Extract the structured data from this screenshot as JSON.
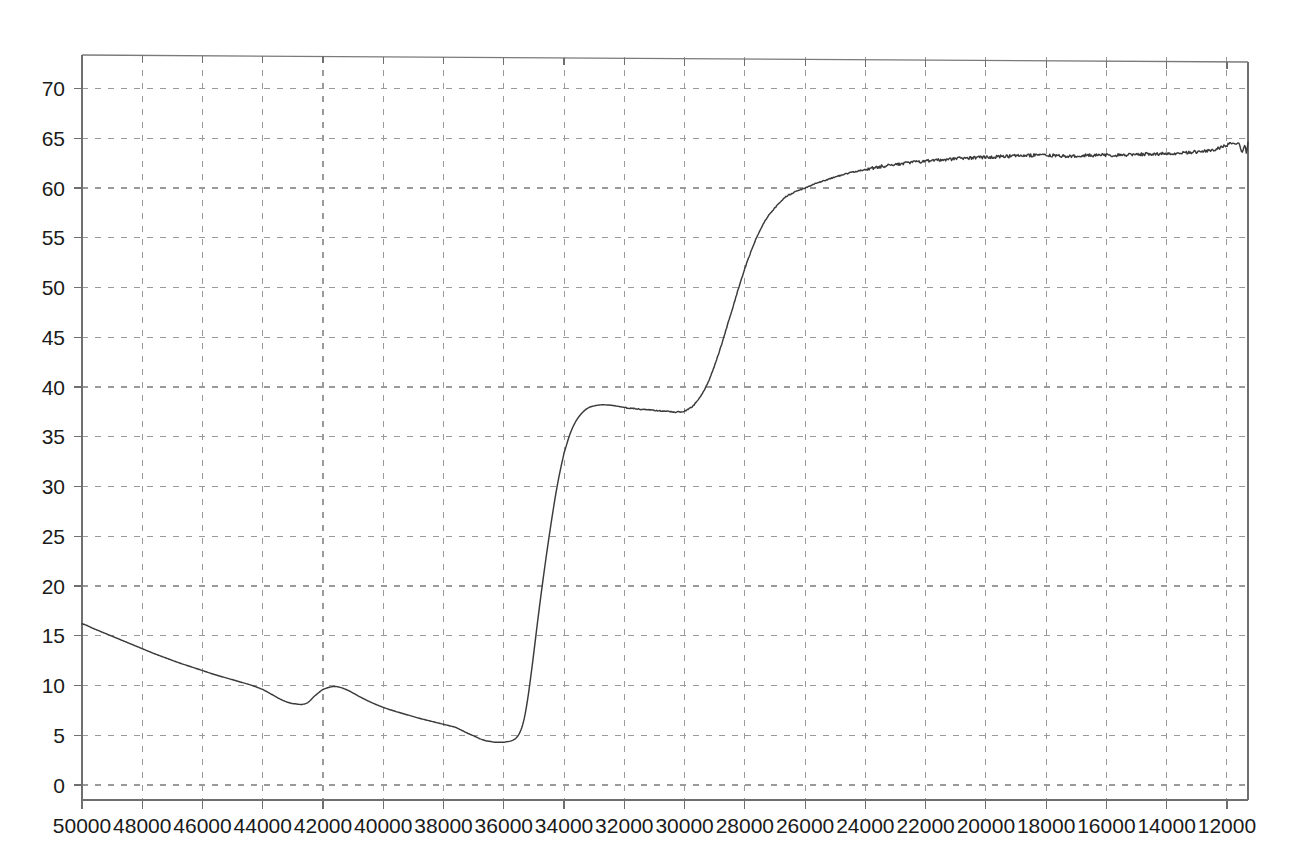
{
  "chart_data": {
    "type": "line",
    "title": "",
    "subtitle": "",
    "xlabel": "",
    "ylabel": "",
    "xlim": [
      50000,
      11300
    ],
    "ylim": [
      0,
      72.5
    ],
    "x_inverted": true,
    "grid": true,
    "legend": null,
    "x_ticks": [
      50000,
      48000,
      46000,
      44000,
      42000,
      40000,
      38000,
      36000,
      34000,
      32000,
      30000,
      28000,
      26000,
      24000,
      22000,
      20000,
      18000,
      16000,
      14000,
      12000
    ],
    "x_tick_labels": [
      "50000",
      "48000",
      "46000",
      "44000",
      "42000",
      "40000",
      "38000",
      "36000",
      "34000",
      "32000",
      "30000",
      "28000",
      "26000",
      "24000",
      "22000",
      "20000",
      "18000",
      "16000",
      "14000",
      "12000"
    ],
    "y_ticks": [
      0,
      5,
      10,
      15,
      20,
      25,
      30,
      35,
      40,
      45,
      50,
      55,
      60,
      65,
      70
    ],
    "y_tick_labels": [
      "0",
      "5",
      "10",
      "15",
      "20",
      "25",
      "30",
      "35",
      "40",
      "45",
      "50",
      "55",
      "60",
      "65",
      "70"
    ],
    "series": [
      {
        "name": "transmittance",
        "color": "#3b3b3b",
        "x": [
          50000,
          49600,
          49200,
          48800,
          48400,
          48000,
          47600,
          47200,
          46800,
          46400,
          46000,
          45600,
          45200,
          44800,
          44400,
          44000,
          43700,
          43400,
          43100,
          42900,
          42700,
          42500,
          42300,
          42000,
          41600,
          41200,
          40800,
          40400,
          40000,
          39600,
          39200,
          38800,
          38400,
          38000,
          37600,
          37400,
          37200,
          37000,
          36900,
          36800,
          36700,
          36600,
          36500,
          36400,
          36300,
          36200,
          36100,
          36000,
          35900,
          35800,
          35700,
          35600,
          35500,
          35400,
          35300,
          35200,
          35100,
          35000,
          34900,
          34800,
          34700,
          34600,
          34500,
          34400,
          34300,
          34200,
          34100,
          34000,
          33800,
          33600,
          33400,
          33200,
          33000,
          32800,
          32600,
          32400,
          32200,
          32000,
          31800,
          31600,
          31400,
          31200,
          31000,
          30800,
          30600,
          30400,
          30200,
          30000,
          29800,
          29600,
          29400,
          29200,
          29000,
          28800,
          28600,
          28400,
          28200,
          28000,
          27800,
          27600,
          27400,
          27200,
          27000,
          26800,
          26600,
          26400,
          26200,
          26000,
          25600,
          25200,
          24800,
          24400,
          24000,
          23600,
          23200,
          22800,
          22400,
          22000,
          21600,
          21200,
          20800,
          20400,
          20000,
          19600,
          19200,
          18800,
          18400,
          18000,
          17600,
          17200,
          16800,
          16400,
          16000,
          15600,
          15200,
          14800,
          14400,
          14000,
          13600,
          13200,
          12800,
          12400,
          12000,
          11800,
          11700,
          11600,
          11500,
          11400,
          11350,
          11300
        ],
        "y": [
          16.2,
          15.7,
          15.2,
          14.7,
          14.2,
          13.7,
          13.2,
          12.75,
          12.3,
          11.9,
          11.5,
          11.1,
          10.75,
          10.4,
          10.05,
          9.6,
          9.1,
          8.6,
          8.25,
          8.15,
          8.1,
          8.3,
          8.9,
          9.6,
          9.9,
          9.55,
          8.9,
          8.3,
          7.8,
          7.4,
          7.05,
          6.7,
          6.4,
          6.1,
          5.8,
          5.5,
          5.2,
          4.95,
          4.8,
          4.65,
          4.55,
          4.45,
          4.4,
          4.35,
          4.3,
          4.3,
          4.3,
          4.3,
          4.35,
          4.4,
          4.5,
          4.7,
          5.1,
          5.8,
          7.0,
          8.8,
          11.0,
          13.4,
          15.9,
          18.3,
          20.6,
          22.8,
          24.9,
          26.9,
          28.8,
          30.5,
          32.0,
          33.4,
          35.3,
          36.6,
          37.4,
          37.9,
          38.1,
          38.2,
          38.2,
          38.15,
          38.05,
          37.95,
          37.85,
          37.8,
          37.75,
          37.7,
          37.65,
          37.6,
          37.55,
          37.5,
          37.5,
          37.6,
          37.9,
          38.5,
          39.4,
          40.6,
          42.2,
          44.0,
          46.0,
          48.0,
          50.0,
          51.9,
          53.6,
          55.1,
          56.3,
          57.3,
          58.0,
          58.7,
          59.2,
          59.5,
          59.8,
          60.0,
          60.5,
          60.9,
          61.3,
          61.6,
          61.85,
          62.1,
          62.3,
          62.45,
          62.6,
          62.7,
          62.8,
          62.9,
          63.0,
          63.05,
          63.1,
          63.15,
          63.2,
          63.25,
          63.3,
          63.3,
          63.25,
          63.2,
          63.25,
          63.3,
          63.3,
          63.3,
          63.35,
          63.4,
          63.4,
          63.45,
          63.5,
          63.6,
          63.7,
          63.9,
          64.3,
          64.5,
          64.4,
          64.5,
          63.6,
          64.3,
          63.5,
          64.6
        ],
        "noise_start_x": 24000,
        "noise_amplitude": 0.16
      }
    ],
    "annotations": [],
    "style": {
      "grid_color": "#9a9a9a",
      "grid_dash": "dashed",
      "axis_color": "#6f6f6f",
      "curve_color": "#3b3b3b",
      "background": "#ffffff"
    },
    "plot_box": {
      "left": 82,
      "right": 1248,
      "top": 53,
      "bottom": 800,
      "y_zero_px": 785,
      "y_per_unit_px": 9.95
    }
  }
}
